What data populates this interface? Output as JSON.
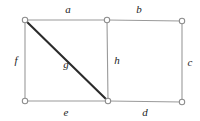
{
  "figure": {
    "width": 200,
    "height": 121,
    "background_color": "#ffffff",
    "edge_color": "#9a9a9a",
    "emphasis_edge_color": "#2b2b2b",
    "vertex_fill_color": "#ffffff",
    "vertex_stroke_color": "#8c8c8c",
    "label_color": "#1d1d1d"
  },
  "vertices": [
    {
      "id": "v-top-left",
      "name": "vertex-top-left",
      "x": 25,
      "y": 20,
      "r": 2.7
    },
    {
      "id": "v-top-middle",
      "name": "vertex-top-middle",
      "x": 107,
      "y": 20,
      "r": 2.7
    },
    {
      "id": "v-top-right",
      "name": "vertex-top-right",
      "x": 182,
      "y": 21,
      "r": 2.7
    },
    {
      "id": "v-bottom-left",
      "name": "vertex-bottom-left",
      "x": 25,
      "y": 101,
      "r": 2.7
    },
    {
      "id": "v-bottom-middle",
      "name": "vertex-bottom-middle",
      "x": 108,
      "y": 101,
      "r": 2.7
    },
    {
      "id": "v-bottom-right",
      "name": "vertex-bottom-right",
      "x": 182,
      "y": 102,
      "r": 2.7
    }
  ],
  "edges": [
    {
      "label": "a",
      "name": "edge-a",
      "from": "v-top-left",
      "to": "v-top-middle",
      "x1": 25,
      "y1": 20,
      "x2": 107,
      "y2": 20,
      "emphasis": false,
      "label_x": 68,
      "label_y": 9
    },
    {
      "label": "b",
      "name": "edge-b",
      "from": "v-top-middle",
      "to": "v-top-right",
      "x1": 107,
      "y1": 20,
      "x2": 182,
      "y2": 21,
      "emphasis": false,
      "label_x": 139,
      "label_y": 9
    },
    {
      "label": "c",
      "name": "edge-c",
      "from": "v-top-right",
      "to": "v-bottom-right",
      "x1": 182,
      "y1": 21,
      "x2": 182,
      "y2": 102,
      "emphasis": false,
      "label_x": 190,
      "label_y": 62
    },
    {
      "label": "d",
      "name": "edge-d",
      "from": "v-bottom-middle",
      "to": "v-bottom-right",
      "x1": 108,
      "y1": 101,
      "x2": 182,
      "y2": 102,
      "emphasis": false,
      "label_x": 145,
      "label_y": 112
    },
    {
      "label": "e",
      "name": "edge-e",
      "from": "v-bottom-left",
      "to": "v-bottom-middle",
      "x1": 25,
      "y1": 101,
      "x2": 108,
      "y2": 101,
      "emphasis": false,
      "label_x": 66,
      "label_y": 112
    },
    {
      "label": "f",
      "name": "edge-f",
      "from": "v-top-left",
      "to": "v-bottom-left",
      "x1": 25,
      "y1": 20,
      "x2": 25,
      "y2": 101,
      "emphasis": false,
      "label_x": 16,
      "label_y": 60
    },
    {
      "label": "g",
      "name": "edge-g",
      "from": "v-top-left",
      "to": "v-bottom-middle",
      "x1": 25,
      "y1": 20,
      "x2": 108,
      "y2": 101,
      "emphasis": true,
      "label_x": 66,
      "label_y": 64
    },
    {
      "label": "h",
      "name": "edge-h",
      "from": "v-top-middle",
      "to": "v-bottom-middle",
      "x1": 107,
      "y1": 20,
      "x2": 108,
      "y2": 101,
      "emphasis": false,
      "label_x": 117,
      "label_y": 60
    }
  ]
}
